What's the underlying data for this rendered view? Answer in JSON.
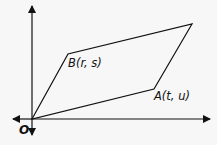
{
  "diagram": {
    "type": "coordinate-plane-parallelogram",
    "axes": {
      "x_arrows": "both",
      "y_arrows": "both"
    },
    "origin_label": "O",
    "points": {
      "B": {
        "label": "B(r, s)"
      },
      "A": {
        "label": "A(t, u)"
      }
    },
    "shape": "parallelogram",
    "vertices_order": [
      "O",
      "B",
      "B+A",
      "A"
    ],
    "colors": {
      "line": "#111111",
      "background": "#f7f7f7"
    }
  }
}
